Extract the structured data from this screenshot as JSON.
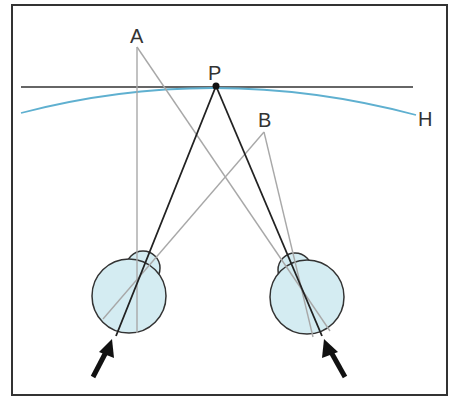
{
  "diagram": {
    "title": "",
    "labels": {
      "A": "A",
      "B": "B",
      "P": "P",
      "H": "H"
    },
    "colors": {
      "frame": "#333333",
      "fixation_line": "#333333",
      "horopter": "#5fb0d0",
      "black_ray": "#222222",
      "gray_ray": "#a8a8a8",
      "eye_fill": "#d4ecf2",
      "eye_stroke": "#333333",
      "arrow": "#111111"
    },
    "points": {
      "A": [
        137,
        47
      ],
      "B": [
        264,
        132
      ],
      "P": [
        216,
        86
      ]
    },
    "eyes": [
      {
        "name": "left",
        "globe_center": [
          129,
          296
        ],
        "globe_r": 37,
        "cornea_center": [
          143,
          268
        ],
        "cornea_r": 17
      },
      {
        "name": "right",
        "globe_center": [
          307,
          297
        ],
        "globe_r": 37,
        "cornea_center": [
          295,
          270
        ],
        "cornea_r": 17
      }
    ]
  }
}
